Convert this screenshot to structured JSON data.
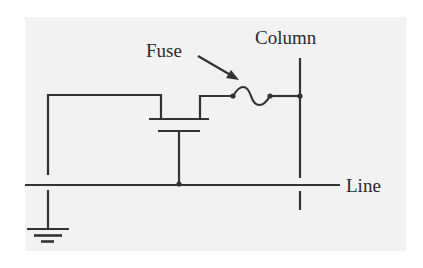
{
  "diagram": {
    "type": "circuit-schematic",
    "labels": {
      "fuse": "Fuse",
      "column": "Column",
      "line": "Line"
    },
    "components": [
      {
        "id": "transistor",
        "kind": "MOSFET",
        "gate": "Line"
      },
      {
        "id": "fuse",
        "kind": "fuse",
        "between": [
          "transistor",
          "Column"
        ]
      },
      {
        "id": "ground",
        "kind": "ground",
        "connected_to": "transistor"
      }
    ],
    "colors": {
      "background": "#ffffff",
      "panel": "#f2f2f2",
      "stroke": "#333333",
      "text": "#2a2a2a"
    }
  }
}
